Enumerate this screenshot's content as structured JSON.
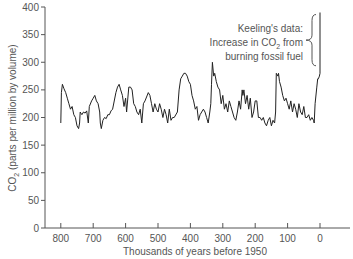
{
  "chart_data": {
    "type": "line",
    "title": "",
    "xlabel": "Thousands of years before 1950",
    "ylabel": "CO2 (parts per million by volume)",
    "ylabel_main": "CO",
    "ylabel_sub": "2",
    "ylabel_rest": " (parts per million by volume)",
    "xlim": [
      850,
      -30
    ],
    "ylim": [
      0,
      400
    ],
    "x_ticks": [
      800,
      700,
      600,
      500,
      400,
      300,
      200,
      100,
      0
    ],
    "x_tick_labels": [
      "800",
      "700",
      "600",
      "500",
      "400",
      "300",
      "200",
      "100",
      "0"
    ],
    "y_ticks": [
      0,
      50,
      100,
      150,
      200,
      250,
      300,
      350,
      400
    ],
    "y_tick_labels": [
      "0",
      "50",
      "100",
      "150",
      "200",
      "250",
      "300",
      "350",
      "400"
    ],
    "grid": false,
    "legend": null,
    "annotation": {
      "line1": "Keeling's data:",
      "line2_pre": "Increase in CO",
      "line2_sub": "2",
      "line2_post": " from",
      "line3": "burning fossil fuel",
      "bracket_ppm_range": [
        290,
        390
      ]
    },
    "series": [
      {
        "name": "CO2 concentration",
        "color": "#222222",
        "x": [
          800,
          798,
          795,
          790,
          785,
          780,
          775,
          770,
          765,
          760,
          755,
          750,
          745,
          742,
          740,
          735,
          730,
          725,
          720,
          715,
          712,
          705,
          700,
          695,
          690,
          685,
          680,
          678,
          675,
          670,
          665,
          660,
          655,
          650,
          645,
          640,
          630,
          625,
          620,
          615,
          610,
          605,
          600,
          597,
          590,
          585,
          580,
          575,
          570,
          565,
          560,
          555,
          550,
          545,
          540,
          530,
          525,
          520,
          515,
          510,
          505,
          500,
          495,
          490,
          485,
          480,
          475,
          470,
          465,
          460,
          455,
          450,
          440,
          435,
          430,
          425,
          420,
          415,
          410,
          405,
          400,
          395,
          390,
          385,
          380,
          375,
          370,
          365,
          360,
          355,
          350,
          345,
          340,
          337,
          335,
          332,
          328,
          325,
          320,
          315,
          310,
          305,
          300,
          295,
          290,
          285,
          280,
          275,
          270,
          265,
          260,
          255,
          250,
          245,
          240,
          238,
          235,
          230,
          225,
          220,
          215,
          210,
          205,
          200,
          195,
          190,
          185,
          180,
          175,
          170,
          165,
          160,
          155,
          150,
          145,
          140,
          137,
          135,
          130,
          128,
          125,
          120,
          115,
          110,
          105,
          100,
          95,
          90,
          85,
          80,
          75,
          70,
          65,
          60,
          55,
          50,
          45,
          40,
          35,
          30,
          25,
          20,
          18,
          15,
          10,
          7,
          5,
          2,
          0,
          0
        ],
        "values": [
          190,
          245,
          260,
          252,
          245,
          235,
          225,
          215,
          220,
          205,
          200,
          185,
          180,
          190,
          210,
          205,
          210,
          208,
          212,
          190,
          220,
          230,
          235,
          240,
          230,
          225,
          210,
          190,
          180,
          195,
          200,
          198,
          205,
          205,
          212,
          215,
          245,
          255,
          260,
          250,
          240,
          220,
          235,
          210,
          255,
          255,
          250,
          225,
          220,
          210,
          205,
          215,
          190,
          225,
          230,
          245,
          240,
          225,
          210,
          225,
          215,
          210,
          225,
          215,
          200,
          215,
          205,
          190,
          215,
          195,
          200,
          200,
          210,
          250,
          270,
          275,
          280,
          280,
          275,
          265,
          260,
          240,
          230,
          215,
          220,
          195,
          205,
          210,
          215,
          210,
          200,
          190,
          210,
          225,
          260,
          300,
          275,
          280,
          265,
          255,
          250,
          225,
          240,
          215,
          225,
          210,
          230,
          220,
          210,
          200,
          195,
          210,
          230,
          215,
          250,
          240,
          250,
          225,
          240,
          215,
          235,
          200,
          210,
          230,
          230,
          200,
          200,
          195,
          200,
          190,
          185,
          195,
          200,
          185,
          195,
          190,
          210,
          280,
          275,
          280,
          265,
          255,
          240,
          230,
          235,
          225,
          215,
          230,
          210,
          225,
          215,
          200,
          225,
          210,
          205,
          220,
          200,
          200,
          205,
          195,
          200,
          195,
          190,
          225,
          255,
          270,
          270,
          275,
          280,
          390
        ]
      }
    ]
  }
}
